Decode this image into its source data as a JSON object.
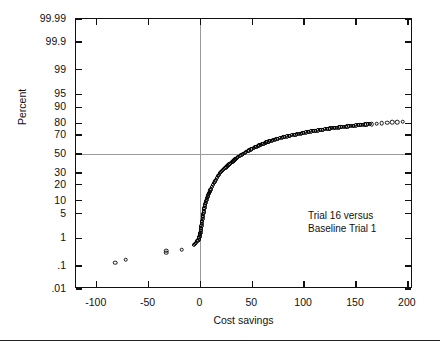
{
  "chart_data": {
    "type": "scatter",
    "title": "",
    "xlabel": "Cost savings",
    "ylabel": "Percent",
    "annotation": [
      "Trial 16 versus",
      "Baseline Trial 1"
    ],
    "yscale": "normal-probability",
    "xlim": [
      -120,
      205
    ],
    "ylim_percent": [
      0.01,
      99.99
    ],
    "grid": false,
    "legend": "none",
    "reference_lines": [
      {
        "orientation": "vertical",
        "x": 0,
        "color": "#9a9a9a"
      },
      {
        "orientation": "horizontal",
        "y_percent": 50,
        "color": "#9a9a9a"
      }
    ],
    "xticks": [
      -100,
      -50,
      0,
      50,
      100,
      150,
      200
    ],
    "xtick_labels": [
      "-100",
      "-50",
      "0",
      "50",
      "100",
      "150",
      "200"
    ],
    "yticks_percent": [
      99.99,
      99.9,
      99,
      95,
      90,
      80,
      70,
      50,
      30,
      20,
      10,
      5,
      1,
      0.1,
      0.01
    ],
    "ytick_labels": [
      "99.99",
      "99.9",
      "99",
      "95",
      "90",
      "80",
      "70",
      "50",
      "30",
      "20",
      "10",
      "5",
      "1",
      ".1",
      ".01"
    ],
    "series": [
      {
        "name": "Cost savings percentiles",
        "marker": "open-circle",
        "color": "#111111",
        "points": [
          [
            -82,
            0.14
          ],
          [
            -72,
            0.18
          ],
          [
            -33,
            0.33
          ],
          [
            -33,
            0.38
          ],
          [
            -18,
            0.42
          ],
          [
            -6,
            0.62
          ],
          [
            -4,
            0.72
          ],
          [
            -3,
            0.82
          ],
          [
            -2,
            0.9
          ],
          [
            -1.5,
            1.0
          ],
          [
            -1,
            1.1
          ],
          [
            -0.5,
            1.25
          ],
          [
            0,
            1.5
          ],
          [
            0.5,
            1.9
          ],
          [
            1,
            2.4
          ],
          [
            1.5,
            3.0
          ],
          [
            2,
            3.7
          ],
          [
            2.5,
            4.5
          ],
          [
            3,
            5.4
          ],
          [
            3.5,
            6.4
          ],
          [
            4,
            7.5
          ],
          [
            5,
            9.0
          ],
          [
            6,
            10.5
          ],
          [
            7,
            12.0
          ],
          [
            8,
            13.5
          ],
          [
            9,
            15.0
          ],
          [
            10,
            16.5
          ],
          [
            11,
            18.0
          ],
          [
            12,
            19.5
          ],
          [
            13,
            21.0
          ],
          [
            14,
            22.5
          ],
          [
            15,
            24.0
          ],
          [
            16,
            25.5
          ],
          [
            17,
            27.0
          ],
          [
            18,
            28.5
          ],
          [
            19,
            30.0
          ],
          [
            21,
            32.0
          ],
          [
            23,
            34.0
          ],
          [
            25,
            36.0
          ],
          [
            27,
            38.0
          ],
          [
            29,
            40.0
          ],
          [
            31,
            42.0
          ],
          [
            33,
            44.0
          ],
          [
            35,
            46.0
          ],
          [
            38,
            48.0
          ],
          [
            41,
            50.0
          ],
          [
            44,
            52.0
          ],
          [
            47,
            54.0
          ],
          [
            50,
            56.0
          ],
          [
            54,
            58.0
          ],
          [
            58,
            60.0
          ],
          [
            62,
            62.0
          ],
          [
            66,
            63.5
          ],
          [
            70,
            65.0
          ],
          [
            75,
            66.5
          ],
          [
            80,
            68.0
          ],
          [
            85,
            69.0
          ],
          [
            90,
            70.0
          ],
          [
            95,
            71.0
          ],
          [
            100,
            72.0
          ],
          [
            105,
            73.0
          ],
          [
            110,
            73.8
          ],
          [
            115,
            74.5
          ],
          [
            120,
            75.2
          ],
          [
            125,
            75.9
          ],
          [
            130,
            76.5
          ],
          [
            135,
            77.0
          ],
          [
            140,
            77.5
          ],
          [
            145,
            78.0
          ],
          [
            150,
            78.5
          ],
          [
            155,
            79.0
          ],
          [
            160,
            79.3
          ],
          [
            165,
            79.6
          ],
          [
            170,
            79.9
          ],
          [
            175,
            80.2
          ],
          [
            180,
            80.5
          ],
          [
            185,
            80.8
          ],
          [
            190,
            81.0
          ],
          [
            195,
            81.3
          ]
        ]
      }
    ]
  },
  "axes": {
    "y_title": "Percent",
    "x_title": "Cost savings"
  }
}
